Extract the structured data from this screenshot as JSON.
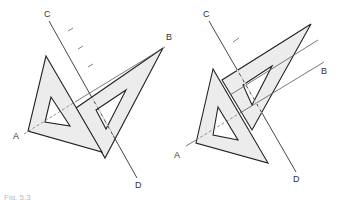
{
  "figure": {
    "caption": "Fig. 5.3",
    "colors": {
      "fill": "#ececec",
      "stroke": "#222222",
      "thin": "#555555"
    },
    "left": {
      "labels": {
        "A": "A",
        "B": "B",
        "C": "C",
        "D": "D"
      }
    },
    "right": {
      "labels": {
        "A": "A",
        "B": "B",
        "B_partial": "B",
        "C": "C",
        "D": "D"
      }
    }
  }
}
